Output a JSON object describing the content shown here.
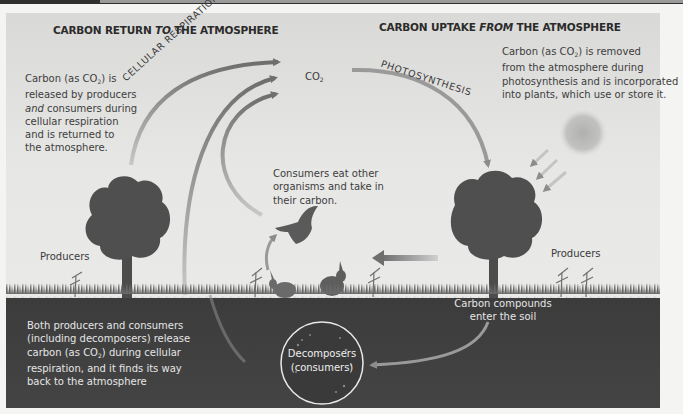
{
  "figure": {
    "left_title": {
      "prefix": "CARBON RETURN ",
      "emph": "TO",
      "suffix": " THE ATMOSPHERE"
    },
    "right_title": {
      "prefix": "CARBON UPTAKE ",
      "emph": "FROM",
      "suffix": " THE ATMOSPHERE"
    },
    "left_text": {
      "line1_a": "Carbon (as CO",
      "line1_sub": "2",
      "line1_b": ") is",
      "line2": "released by producers",
      "line3_emph": "and",
      "line3_rest": " consumers during",
      "line4": "cellular respiration",
      "line5": "and is returned to",
      "line6": "the atmosphere."
    },
    "right_text": {
      "line1_a": "Carbon (as CO",
      "line1_sub": "2",
      "line1_b": ") is removed",
      "line2": "from the atmosphere during",
      "line3": "photosynthesis and is incorporated",
      "line4": "into plants, which use or store it."
    },
    "co2_label": {
      "main": "CO",
      "sub": "2"
    },
    "cellular_respiration_label": "CELLULAR RESPIRATION",
    "photosynthesis_label": "PHOTOSYNTHESIS",
    "consumers_text": {
      "line1": "Consumers eat other",
      "line2": "organisms and take in",
      "line3": "their carbon."
    },
    "producers_left": "Producers",
    "producers_right": "Producers",
    "soil_compounds": {
      "line1": "Carbon compounds",
      "line2": "enter the soil"
    },
    "soil_text": {
      "line1": "Both producers and consumers",
      "line2": "(including decomposers) release",
      "line3_a": "carbon (as CO",
      "line3_sub": "2",
      "line3_b": ") during cellular",
      "line4": "respiration, and it finds its way",
      "line5": "back to the atmosphere"
    },
    "decomposers": {
      "line1": "Decomposers",
      "line2": "(consumers)"
    }
  },
  "colors": {
    "respiration_arrow": "#7a7a7a",
    "photosynthesis_arrow": "#8a8a8a",
    "tree": "#4a4a4a",
    "soil": "#3f3f3f",
    "sky": "#e6e6e4",
    "sun": "#b8b8b6"
  }
}
